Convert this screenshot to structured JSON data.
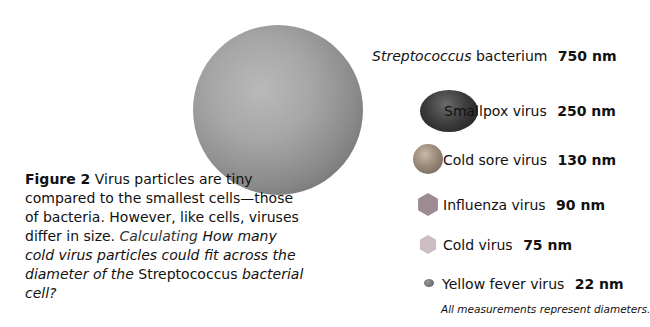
{
  "caption": {
    "figure_label": "Figure 2",
    "text": "Virus particles are tiny compared to the smallest cells—those of bacteria. However, like cells, viruses differ in size.",
    "question_label": "Calculating",
    "question_part1": "How many cold virus particles could fit across the diameter of the",
    "question_species": "Streptococcus",
    "question_part2": "bacterial cell?"
  },
  "items": [
    {
      "name": "Streptococcus",
      "suffix": "bacterium",
      "size": "750 nm"
    },
    {
      "name": "Smallpox virus",
      "size": "250 nm"
    },
    {
      "name": "Cold sore virus",
      "size": "130 nm"
    },
    {
      "name": "Influenza virus",
      "size": "90 nm"
    },
    {
      "name": "Cold virus",
      "size": "75 nm"
    },
    {
      "name": "Yellow fever virus",
      "size": "22 nm"
    }
  ],
  "note": "All measurements represent diameters."
}
